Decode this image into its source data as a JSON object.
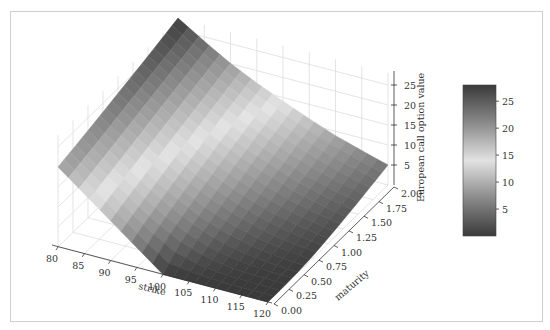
{
  "chart_data": {
    "type": "surface3d",
    "title": "",
    "xlabel": "strike",
    "ylabel": "maturity",
    "zlabel": "European call option value",
    "x_ticks": [
      80,
      85,
      90,
      95,
      100,
      105,
      110,
      115,
      120
    ],
    "y_ticks": [
      "0.00",
      "0.25",
      "0.50",
      "0.75",
      "1.00",
      "1.25",
      "1.50",
      "1.75",
      "2.00"
    ],
    "z_ticks": [
      5,
      10,
      15,
      20,
      25
    ],
    "xlim": [
      80,
      120
    ],
    "ylim": [
      0,
      2
    ],
    "zlim": [
      0,
      28
    ],
    "grid": true,
    "colormap": "grey diverging (dark-light-dark)",
    "colorbar": {
      "ticks": [
        5,
        10,
        15,
        20,
        25
      ],
      "range": [
        0.0,
        28.0
      ],
      "position": "right"
    },
    "surface_corners": [
      {
        "strike": 80,
        "maturity": 0.0,
        "value": 20.0
      },
      {
        "strike": 80,
        "maturity": 2.0,
        "value": 28.0
      },
      {
        "strike": 120,
        "maturity": 0.0,
        "value": 0.0
      },
      {
        "strike": 120,
        "maturity": 2.0,
        "value": 8.0
      }
    ],
    "sample_grid": {
      "strikes": [
        80,
        85,
        90,
        95,
        100,
        105,
        110,
        115,
        120
      ],
      "maturities": [
        0.0,
        0.25,
        0.5,
        0.75,
        1.0,
        1.25,
        1.5,
        1.75,
        2.0
      ],
      "values": [
        [
          20.0,
          20.9,
          21.8,
          22.8,
          23.8,
          24.8,
          25.8,
          26.9,
          28.0
        ],
        [
          15.0,
          16.1,
          17.2,
          18.3,
          19.5,
          20.6,
          21.7,
          22.8,
          23.9
        ],
        [
          10.0,
          11.4,
          12.7,
          14.0,
          15.3,
          16.5,
          17.7,
          18.9,
          20.1
        ],
        [
          5.0,
          7.0,
          8.6,
          10.2,
          11.6,
          13.0,
          14.4,
          15.7,
          16.9
        ],
        [
          0.0,
          3.4,
          5.3,
          6.9,
          8.5,
          10.0,
          11.4,
          12.8,
          14.1
        ],
        [
          0.0,
          1.2,
          2.8,
          4.4,
          5.9,
          7.4,
          8.8,
          10.1,
          11.4
        ],
        [
          0.0,
          0.3,
          1.3,
          2.5,
          3.8,
          5.1,
          6.4,
          7.7,
          8.9
        ],
        [
          0.0,
          0.1,
          0.5,
          1.3,
          2.3,
          3.4,
          4.5,
          5.7,
          6.9
        ],
        [
          0.0,
          0.0,
          0.2,
          0.6,
          1.3,
          2.1,
          3.0,
          4.0,
          5.0
        ]
      ]
    }
  }
}
